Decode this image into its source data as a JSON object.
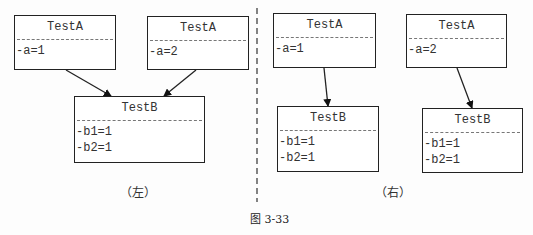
{
  "left": {
    "label": "（左）",
    "parents": [
      {
        "title": "TestA",
        "attrs": [
          "-a=1"
        ]
      },
      {
        "title": "TestA",
        "attrs": [
          "-a=2"
        ]
      }
    ],
    "child": {
      "title": "TestB",
      "attrs": [
        "-b1=1",
        "-b2=1"
      ]
    }
  },
  "right": {
    "label": "（右）",
    "parents": [
      {
        "title": "TestA",
        "attrs": [
          "-a=1"
        ]
      },
      {
        "title": "TestA",
        "attrs": [
          "-a=2"
        ]
      }
    ],
    "children": [
      {
        "title": "TestB",
        "attrs": [
          "-b1=1",
          "-b2=1"
        ]
      },
      {
        "title": "TestB",
        "attrs": [
          "-b1=1",
          "-b2=1"
        ]
      }
    ]
  },
  "caption": "图 3-33"
}
